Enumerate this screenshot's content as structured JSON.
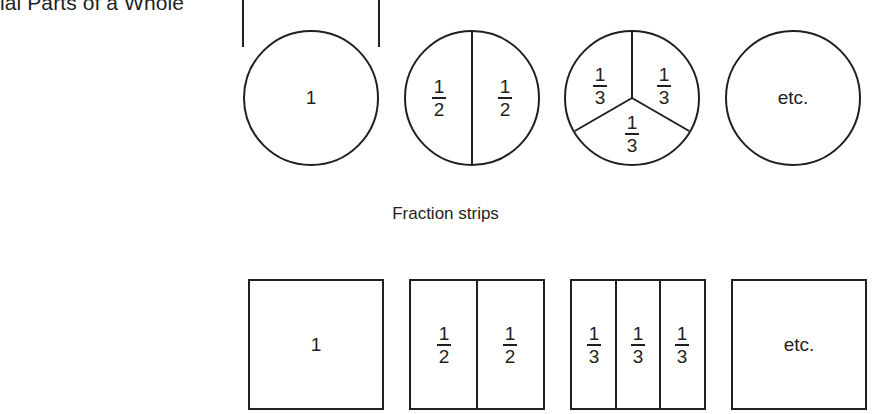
{
  "page": {
    "section_title": "ial Parts of a Whole",
    "background_color": "#ffffff",
    "line_color": "#231f20"
  },
  "captions": {
    "fraction_strips": "Fraction strips"
  },
  "fraction_circles": {
    "label": "Fraction circles",
    "items": [
      {
        "id": "circle-whole",
        "parts": 1,
        "labels": [
          "1"
        ],
        "type": "whole"
      },
      {
        "id": "circle-halves",
        "parts": 2,
        "labels": [
          "1/2",
          "1/2"
        ],
        "numerators": [
          "1",
          "1"
        ],
        "denominators": [
          "2",
          "2"
        ],
        "type": "halves"
      },
      {
        "id": "circle-thirds",
        "parts": 3,
        "labels": [
          "1/3",
          "1/3",
          "1/3"
        ],
        "numerators": [
          "1",
          "1",
          "1"
        ],
        "denominators": [
          "3",
          "3",
          "3"
        ],
        "type": "thirds"
      },
      {
        "id": "circle-etc",
        "parts": 0,
        "labels": [
          "etc."
        ],
        "type": "etcetera"
      }
    ]
  },
  "fraction_strips": {
    "label": "Fraction strips",
    "items": [
      {
        "id": "strip-whole",
        "parts": 1,
        "labels": [
          "1"
        ],
        "type": "whole"
      },
      {
        "id": "strip-halves",
        "parts": 2,
        "labels": [
          "1/2",
          "1/2"
        ],
        "numerators": [
          "1",
          "1"
        ],
        "denominators": [
          "2",
          "2"
        ],
        "type": "halves"
      },
      {
        "id": "strip-thirds",
        "parts": 3,
        "labels": [
          "1/3",
          "1/3",
          "1/3"
        ],
        "numerators": [
          "1",
          "1",
          "1"
        ],
        "denominators": [
          "3",
          "3",
          "3"
        ],
        "type": "thirds"
      },
      {
        "id": "strip-etc",
        "parts": 0,
        "labels": [
          "etc."
        ],
        "type": "etcetera"
      }
    ]
  },
  "text": {
    "one": "1",
    "etc": "etc.",
    "num_1": "1",
    "den_2": "2",
    "den_3": "3"
  }
}
